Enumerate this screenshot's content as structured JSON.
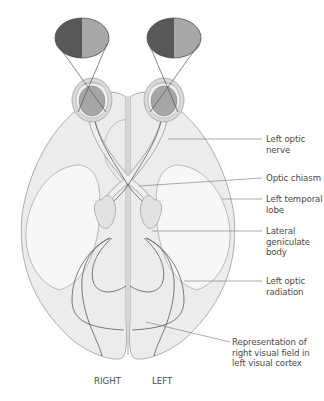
{
  "diagram": {
    "type": "anatomical-visual-pathway",
    "colors": {
      "brain_fill": "#ececec",
      "brain_stroke": "#9a9a9a",
      "temporal_fill": "#f7f7f7",
      "eye_fill": "#a6a6a6",
      "eye_ring": "#d9d9d9",
      "field_dark": "#585858",
      "field_light": "#a8a8a8",
      "pathway_line": "#6a6a6a",
      "leader_line": "#777777",
      "text": "#4a4a4a"
    },
    "visual_fields": [
      {
        "side": "right-eye",
        "left_half": "dark",
        "right_half": "light"
      },
      {
        "side": "left-eye",
        "left_half": "dark",
        "right_half": "light"
      }
    ],
    "labels": [
      {
        "id": "left-optic-nerve",
        "text": "Left optic\nnerve"
      },
      {
        "id": "optic-chiasm",
        "text": "Optic chiasm"
      },
      {
        "id": "left-temporal-lobe",
        "text": "Left temporal\nlobe"
      },
      {
        "id": "lateral-geniculate-body",
        "text": "Lateral\ngeniculate\nbody"
      },
      {
        "id": "left-optic-radiation",
        "text": "Left optic\nradiation"
      },
      {
        "id": "representation-right-visual-field",
        "text": "Representation of\nright visual field in\nleft visual cortex"
      }
    ],
    "side_labels": {
      "right": "RIGHT",
      "left": "LEFT"
    }
  }
}
